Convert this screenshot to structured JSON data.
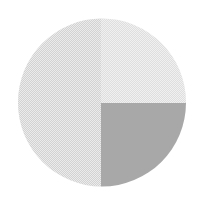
{
  "canvas": {
    "width": 203,
    "height": 203,
    "background_color": "#ffffff",
    "title": "Quadrant-shaded circle"
  },
  "shape": {
    "type": "circle",
    "center_x": 102,
    "center_y": 102.5,
    "radius": 84,
    "stroke": "none",
    "description": "Circle divided into four quadrants by a vertical and a horizontal cut through the center"
  },
  "dither": {
    "enabled": true,
    "cell_size": 2,
    "pattern": "checkerboard",
    "highlight_color": "#ffffff",
    "opacity": 0.55,
    "note": "Fine checkerboard stipple texture visible on the three light quadrants"
  },
  "quadrants": [
    {
      "id": "top-left",
      "label": "Top left quadrant",
      "fill": "#d2d2d2",
      "dithered": true,
      "x_range": [
        18,
        101
      ],
      "y_range": [
        19,
        103
      ]
    },
    {
      "id": "top-right",
      "label": "Top right quadrant",
      "fill": "#dedede",
      "dithered": true,
      "x_range": [
        101,
        186
      ],
      "y_range": [
        19,
        103
      ]
    },
    {
      "id": "bottom-left",
      "label": "Bottom left quadrant",
      "fill": "#d2d2d2",
      "dithered": true,
      "x_range": [
        18,
        101
      ],
      "y_range": [
        103,
        186
      ]
    },
    {
      "id": "bottom-right",
      "label": "Bottom right quadrant",
      "fill": "#a8a8a8",
      "dithered": false,
      "x_range": [
        101,
        186
      ],
      "y_range": [
        103,
        186
      ]
    }
  ],
  "dividers": [
    {
      "id": "vertical-divider",
      "orientation": "vertical",
      "position": 101,
      "extent": "full-diameter"
    },
    {
      "id": "horizontal-divider",
      "orientation": "horizontal",
      "position": 103,
      "extent": "right-half-only"
    }
  ]
}
